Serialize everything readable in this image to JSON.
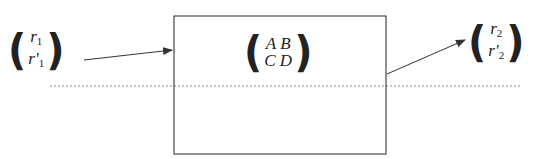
{
  "diagram": {
    "input_vector": {
      "top": "r",
      "top_sub": "1",
      "bottom": "r′",
      "bottom_sub": "1"
    },
    "system_matrix": {
      "row1": "A B",
      "row2": "C D"
    },
    "output_vector": {
      "top": "r",
      "top_sub": "2",
      "bottom": "r′",
      "bottom_sub": "2"
    },
    "colors": {
      "stroke": "#555555",
      "text": "#222222",
      "axis": "#888888"
    }
  }
}
